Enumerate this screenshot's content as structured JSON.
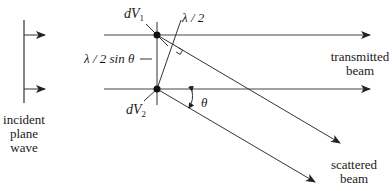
{
  "diagram": {
    "labels": {
      "dV1": {
        "base": "dV",
        "sub": "1"
      },
      "dV2": {
        "base": "dV",
        "sub": "2"
      },
      "half_lambda": "λ / 2",
      "path_spacing": "λ / 2 sin θ",
      "theta": "θ",
      "transmitted_line1": "transmitted",
      "transmitted_line2": "beam",
      "scattered_line1": "scattered",
      "scattered_line2": "beam",
      "incident_line1": "incident",
      "incident_line2": "plane",
      "incident_line3": "wave"
    },
    "colors": {
      "line": "#333333",
      "text": "#1a1a1a",
      "background": "#ffffff"
    }
  }
}
